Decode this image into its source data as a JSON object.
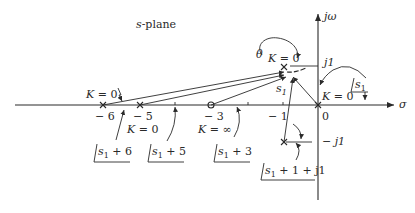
{
  "title": "s-plane",
  "axes": {
    "real_label": "σ",
    "imag_label": "jω",
    "origin_label": "0",
    "j1_label": "j1",
    "neg_j1_label": "− j1",
    "tick_neg1": "− 1"
  },
  "poles": [
    {
      "id": "pole-neg6",
      "value": "− 6",
      "k_label": "K = 0"
    },
    {
      "id": "pole-neg5",
      "value": "− 5",
      "k_label": "K = 0"
    },
    {
      "id": "pole-origin",
      "value": "0",
      "k_label": "K = 0"
    },
    {
      "id": "pole-upper",
      "value": "−1 + j1",
      "k_label": "K = 0"
    },
    {
      "id": "pole-lower",
      "value": "−1 − j1"
    }
  ],
  "zeros": [
    {
      "id": "zero-neg3",
      "value": "− 3",
      "k_label": "K = ∞"
    }
  ],
  "test_point": {
    "label": "s",
    "subscript": "1"
  },
  "angle_label": "θ",
  "angle_labels": [
    {
      "id": "angle-s1-plus-6",
      "text": "s",
      "sub": "1",
      "rest": " + 6"
    },
    {
      "id": "angle-s1-plus-5",
      "text": "s",
      "sub": "1",
      "rest": " + 5"
    },
    {
      "id": "angle-s1-plus-3",
      "text": "s",
      "sub": "1",
      "rest": " + 3"
    },
    {
      "id": "angle-s1-plus-1-plus-j1",
      "text": "s",
      "sub": "1",
      "rest": " + 1 + j1"
    },
    {
      "id": "angle-s1",
      "text": "s",
      "sub": "1",
      "rest": ""
    }
  ],
  "labels": {
    "k0_left": "K = 0",
    "k0_neg5": "K = 0",
    "kinf_neg3": "K = ∞",
    "k0_upper": "K = 0",
    "k0_origin": "K = 0",
    "neg6": "− 6",
    "neg5": "− 5",
    "neg3": "− 3"
  }
}
